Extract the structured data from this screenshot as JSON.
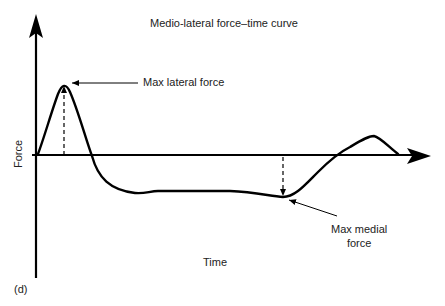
{
  "title": "Medio-lateral force–time curve",
  "y_axis_label": "Force",
  "x_axis_label": "Time",
  "panel_label": "(d)",
  "annotations": {
    "max_lateral": "Max lateral force",
    "max_medial_line1": "Max medial",
    "max_medial_line2": "force"
  },
  "colors": {
    "line": "#000000",
    "text": "#222222",
    "background": "#ffffff"
  }
}
